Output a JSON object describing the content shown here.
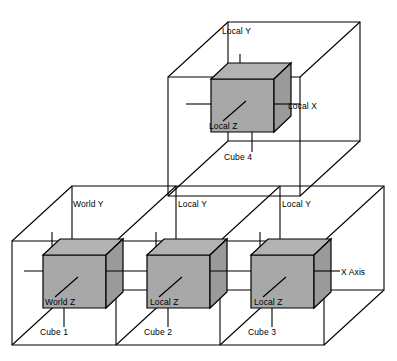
{
  "diagram": {
    "colors": {
      "cube_front_fill": "#a8a8a8",
      "cube_top_fill": "#b2b2b2",
      "cube_side_fill": "#9a9a9a",
      "stroke": "#000000",
      "background": "#ffffff"
    },
    "cubes": [
      {
        "id": "cube-1",
        "name": "Cube 1",
        "y_axis_label": "World Y",
        "z_axis_label": "World Z",
        "x_axis_label": ""
      },
      {
        "id": "cube-2",
        "name": "Cube 2",
        "y_axis_label": "Local Y",
        "z_axis_label": "Local Z",
        "x_axis_label": ""
      },
      {
        "id": "cube-3",
        "name": "Cube 3",
        "y_axis_label": "Local Y",
        "z_axis_label": "Local Z",
        "x_axis_label": "X Axis"
      },
      {
        "id": "cube-4",
        "name": "Cube 4",
        "y_axis_label": "Local Y",
        "z_axis_label": "Local Z",
        "x_axis_label": "Local X"
      }
    ]
  }
}
